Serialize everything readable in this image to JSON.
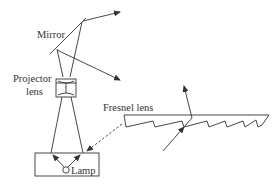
{
  "diagram": {
    "labels": {
      "mirror": "Mirror",
      "projector_lens_line1": "Projector",
      "projector_lens_line2": "lens",
      "fresnel_lens": "Fresnel lens",
      "lamp": "Lamp"
    },
    "colors": {
      "line": "#333333",
      "background": "#ffffff"
    }
  }
}
